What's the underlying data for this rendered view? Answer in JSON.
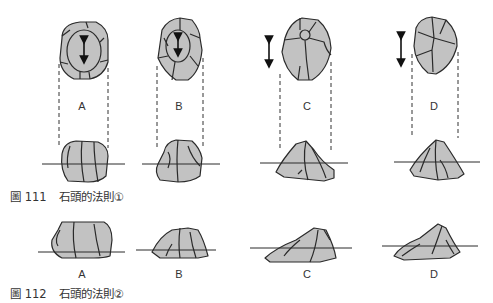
{
  "figure111": {
    "caption_prefix": "圖 111",
    "caption_title": "石頭的法則①",
    "labels": [
      "A",
      "B",
      "C",
      "D"
    ]
  },
  "figure112": {
    "caption_prefix": "圖 112",
    "caption_title": "石頭的法則②",
    "labels": [
      "A",
      "B",
      "C",
      "D"
    ]
  },
  "colors": {
    "stone_fill": "#c2c2c2",
    "stroke": "#2a2a2a",
    "text": "#333333"
  }
}
